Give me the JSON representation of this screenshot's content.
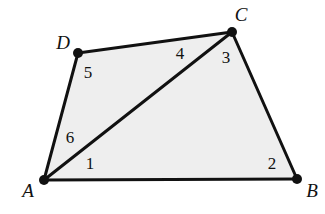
{
  "figure": {
    "kind": "geometry-diagram",
    "shape_name": "quadrilateral-with-diagonal",
    "canvas": {
      "width": 325,
      "height": 214
    },
    "colors": {
      "background": "#ffffff",
      "interior_fill": "#eeeeee",
      "stroke": "#111111",
      "vertex_dot": "#111111",
      "text": "#111111"
    },
    "stroke_width": 3,
    "vertex_dot_radius": 5
  },
  "vertices": [
    {
      "id": "A",
      "label": "A",
      "x": 44,
      "y": 180,
      "label_x": 28,
      "label_y": 190
    },
    {
      "id": "B",
      "label": "B",
      "x": 297,
      "y": 179,
      "label_x": 312,
      "label_y": 190
    },
    {
      "id": "C",
      "label": "C",
      "x": 232,
      "y": 32,
      "label_x": 241,
      "label_y": 14
    },
    {
      "id": "D",
      "label": "D",
      "x": 78,
      "y": 53,
      "label_x": 63,
      "label_y": 42
    }
  ],
  "edges": [
    {
      "id": "AB",
      "from": "A",
      "to": "B",
      "type": "side"
    },
    {
      "id": "BC",
      "from": "B",
      "to": "C",
      "type": "side"
    },
    {
      "id": "CD",
      "from": "C",
      "to": "D",
      "type": "side"
    },
    {
      "id": "DA",
      "from": "D",
      "to": "A",
      "type": "side"
    },
    {
      "id": "AC",
      "from": "A",
      "to": "C",
      "type": "diagonal"
    }
  ],
  "angle_labels": [
    {
      "id": "angle-1",
      "label": "1",
      "x": 90,
      "y": 163,
      "at_vertex": "A"
    },
    {
      "id": "angle-2",
      "label": "2",
      "x": 272,
      "y": 163,
      "at_vertex": "B"
    },
    {
      "id": "angle-3",
      "label": "3",
      "x": 226,
      "y": 57,
      "at_vertex": "C"
    },
    {
      "id": "angle-4",
      "label": "4",
      "x": 180,
      "y": 53,
      "at_vertex": "C"
    },
    {
      "id": "angle-5",
      "label": "5",
      "x": 88,
      "y": 72,
      "at_vertex": "D"
    },
    {
      "id": "angle-6",
      "label": "6",
      "x": 70,
      "y": 137,
      "at_vertex": "A"
    }
  ],
  "polygon_points": "44,180 297,179 232,32 78,53"
}
